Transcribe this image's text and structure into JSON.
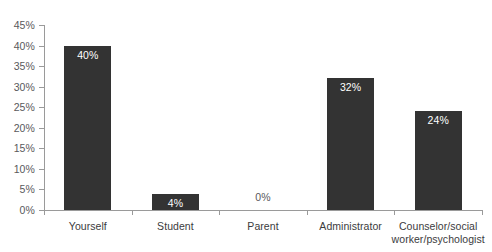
{
  "chart_data": {
    "type": "bar",
    "title": "",
    "subtitle": "",
    "xlabel": "",
    "ylabel": "",
    "categories": [
      "Yourself",
      "Student",
      "Parent",
      "Administrator",
      "Counselor/social\nworker/psychologist"
    ],
    "values": [
      40,
      4,
      0,
      32,
      24
    ],
    "value_labels": [
      "40%",
      "4%",
      "0%",
      "32%",
      "24%"
    ],
    "ylim": [
      0,
      45
    ],
    "ytick_values": [
      0,
      5,
      10,
      15,
      20,
      25,
      30,
      35,
      40,
      45
    ],
    "ytick_labels": [
      "0%",
      "5%",
      "10%",
      "15%",
      "20%",
      "25%",
      "30%",
      "35%",
      "40%",
      "45%"
    ],
    "grid": false,
    "legend": false,
    "legend_position": "none",
    "colors": {
      "bar": "#333333",
      "axis": "#9a9a9a",
      "tick_label": "#59595b",
      "category_label": "#3b3b3d",
      "value_label_inside": "#ffffff",
      "value_label_outside": "#59595b",
      "background": "#ffffff"
    }
  }
}
